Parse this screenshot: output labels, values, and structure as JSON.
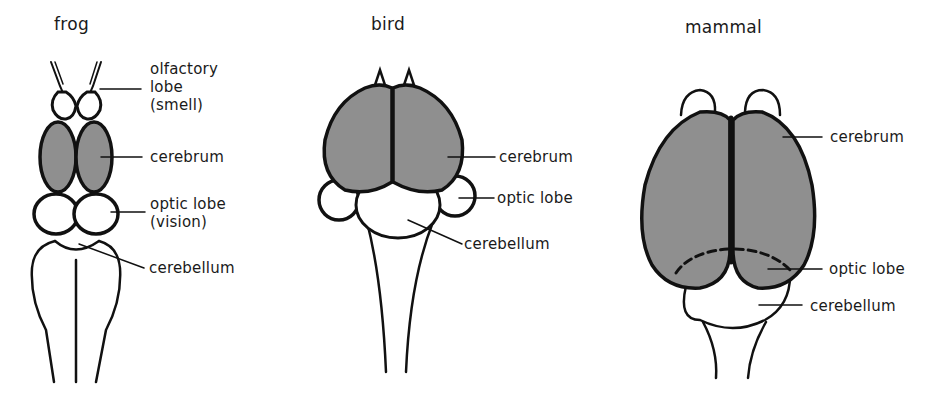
{
  "figure": {
    "colors": {
      "outline": "#111111",
      "cerebrum_fill": "#8f8f8f",
      "background": "#ffffff"
    },
    "panels": [
      {
        "id": "frog",
        "title": "frog",
        "labels": {
          "olfactory_lobe": "olfactory\nlobe\n(smell)",
          "cerebrum": "cerebrum",
          "optic_lobe": "optic lobe\n(vision)",
          "cerebellum": "cerebellum"
        }
      },
      {
        "id": "bird",
        "title": "bird",
        "labels": {
          "cerebrum": "cerebrum",
          "optic_lobe": "optic lobe",
          "cerebellum": "cerebellum"
        }
      },
      {
        "id": "mammal",
        "title": "mammal",
        "labels": {
          "cerebrum": "cerebrum",
          "optic_lobe": "optic lobe",
          "cerebellum": "cerebellum"
        }
      }
    ]
  }
}
